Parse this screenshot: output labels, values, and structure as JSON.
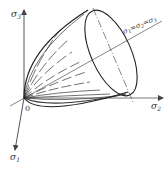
{
  "diagram": {
    "origin_label": "0",
    "axes": [
      {
        "id": "sigma1",
        "symbol": "σ",
        "subscript": "1",
        "direction": "down-left"
      },
      {
        "id": "sigma2",
        "symbol": "σ",
        "subscript": "2",
        "direction": "right"
      },
      {
        "id": "sigma3",
        "symbol": "σ",
        "subscript": "3",
        "direction": "up"
      }
    ],
    "hydrostatic_axis": {
      "label": "σ1=σ2=σ3",
      "parts": [
        {
          "symbol": "σ",
          "subscript": "1"
        },
        {
          "text": "="
        },
        {
          "symbol": "σ",
          "subscript": "2"
        },
        {
          "text": "="
        },
        {
          "symbol": "σ",
          "subscript": "3"
        }
      ]
    },
    "colors": {
      "line": "#333333",
      "background": "#ffffff"
    }
  }
}
